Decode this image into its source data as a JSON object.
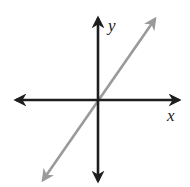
{
  "diagram": {
    "type": "coordinate-plane",
    "labels": {
      "x_axis": "x",
      "y_axis": "y"
    },
    "colors": {
      "axes": "#1e1e1e",
      "line": "#9a9a9a",
      "background": "#ffffff"
    },
    "geometry": {
      "origin": [
        98,
        100
      ],
      "x_axis": {
        "from": [
          13,
          100
        ],
        "to": [
          182,
          100
        ]
      },
      "y_axis": {
        "from": [
          98,
          184
        ],
        "to": [
          98,
          15
        ]
      },
      "line": {
        "from": [
          41,
          183
        ],
        "to": [
          157,
          16
        ]
      }
    }
  }
}
